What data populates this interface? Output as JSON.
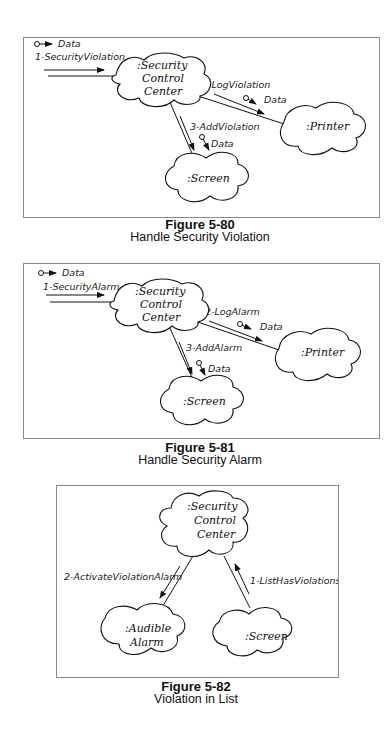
{
  "figures": [
    {
      "number": "Figure 5-80",
      "title": "Handle Security Violation",
      "objects": {
        "center": [
          ":Security",
          "Control",
          "Center"
        ],
        "printer": ":Printer",
        "screen": ":Screen"
      },
      "messages": {
        "m1": "1-SecurityViolation",
        "m2": "2-LogViolation",
        "m3": "3-AddViolation"
      },
      "data_label": "Data"
    },
    {
      "number": "Figure 5-81",
      "title": "Handle Security Alarm",
      "objects": {
        "center": [
          ":Security",
          "Control",
          "Center"
        ],
        "printer": ":Printer",
        "screen": ":Screen"
      },
      "messages": {
        "m1": "1-SecurityAlarm",
        "m2": "2-LogAlarm",
        "m3": "3-AddAlarm"
      },
      "data_label": "Data"
    },
    {
      "number": "Figure 5-82",
      "title": "Violation in List",
      "objects": {
        "center": [
          ":Security",
          "Control",
          "Center"
        ],
        "alarm": [
          ":Audible",
          "Alarm"
        ],
        "screen": ":Screen"
      },
      "messages": {
        "m1": "1-ListHasViolations",
        "m2": "2-ActivateViolationAlarm"
      }
    }
  ]
}
